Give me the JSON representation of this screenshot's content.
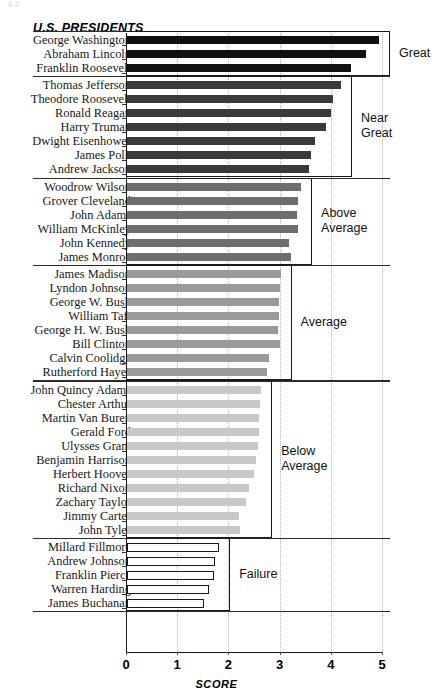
{
  "page_artifact": "4-2",
  "chart_data": {
    "type": "bar",
    "orientation": "horizontal",
    "title": "U.S. PRESIDENTS",
    "xlabel": "SCORE",
    "ylabel": "",
    "xlim": [
      0,
      5
    ],
    "xticks": [
      0,
      1,
      2,
      3,
      4,
      5
    ],
    "xtick_labels": [
      "0",
      "1",
      "2",
      "3",
      "4",
      "5"
    ],
    "grid": "vertical-dotted",
    "legend": "none",
    "categories": [
      "George Washington",
      "Abraham Lincoln",
      "Franklin Roosevelt",
      "Thomas Jefferson",
      "Theodore Roosevelt",
      "Ronald Reagan",
      "Harry Truman",
      "Dwight Eisenhower",
      "James Polk",
      "Andrew Jackson",
      "Woodrow Wilson",
      "Grover Cleveland",
      "John Adams",
      "William McKinley",
      "John Kennedy",
      "James Monroe",
      "James Madison",
      "Lyndon Johnson",
      "George W. Bush",
      "William Taft",
      "George H. W. Bush",
      "Bill Clinton",
      "Calvin Coolidge",
      "Rutherford Hayes",
      "John Quincy Adams",
      "Chester Arthur",
      "Martin Van Buren",
      "Gerald Ford",
      "Ulysses Grant",
      "Benjamin Harrison",
      "Herbert Hoover",
      "Richard Nixon",
      "Zachary Taylor",
      "Jimmy Carter",
      "John Tyler",
      "Millard Fillmore",
      "Andrew Johnson",
      "Franklin Pierce",
      "Warren Harding",
      "James Buchanan"
    ],
    "values": [
      4.92,
      4.67,
      4.38,
      4.18,
      4.02,
      3.98,
      3.88,
      3.67,
      3.59,
      3.55,
      3.4,
      3.34,
      3.32,
      3.34,
      3.16,
      3.2,
      3.0,
      2.98,
      2.96,
      2.96,
      2.94,
      2.98,
      2.77,
      2.73,
      2.62,
      2.6,
      2.58,
      2.58,
      2.56,
      2.52,
      2.48,
      2.38,
      2.33,
      2.19,
      2.21,
      1.8,
      1.72,
      1.7,
      1.6,
      1.5
    ],
    "groups": [
      {
        "label": "Great",
        "color": "#111111",
        "start": 0,
        "count": 3,
        "outlined": false
      },
      {
        "label": "Near\nGreat",
        "color": "#3a3a3a",
        "start": 3,
        "count": 7,
        "outlined": false
      },
      {
        "label": "Above\nAverage",
        "color": "#6e6e6e",
        "start": 10,
        "count": 6,
        "outlined": false
      },
      {
        "label": "Average",
        "color": "#9a9a9a",
        "start": 16,
        "count": 8,
        "outlined": false
      },
      {
        "label": "Below\nAverage",
        "color": "#c8c8c8",
        "start": 24,
        "count": 11,
        "outlined": false
      },
      {
        "label": "Failure",
        "color": "#ffffff",
        "start": 35,
        "count": 5,
        "outlined": true
      }
    ]
  }
}
